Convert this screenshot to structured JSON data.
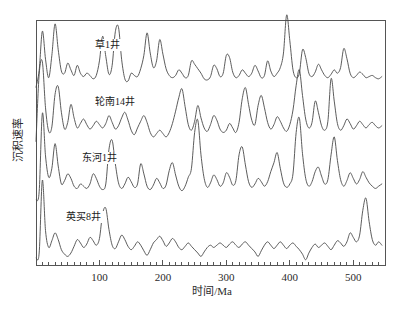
{
  "chart_data": {
    "type": "line",
    "title": "",
    "xlabel": "时间/Ma",
    "ylabel": "沉积速率",
    "xlim": [
      0,
      550
    ],
    "ylim": [
      0,
      4
    ],
    "grid": false,
    "legend_position": "inline-labels",
    "xticks": [
      100,
      200,
      300,
      400,
      500
    ],
    "xtick_labels": [
      "100",
      "200",
      "300",
      "400",
      "500"
    ],
    "xminor_tick_interval": 10,
    "yticks": [],
    "ytick_labels": [],
    "x_step": 5,
    "series": [
      {
        "name": "草1井",
        "label": "草1井",
        "label_x": 95,
        "offset_index": 0,
        "color": "#4a4a4a",
        "values": [
          0.05,
          0.35,
          1.05,
          0.55,
          0.22,
          0.62,
          1.18,
          0.72,
          0.34,
          0.3,
          0.48,
          0.36,
          0.26,
          0.44,
          0.3,
          0.24,
          0.3,
          0.26,
          0.2,
          0.26,
          0.52,
          0.96,
          0.6,
          0.28,
          0.44,
          1.04,
          1.12,
          0.54,
          0.2,
          0.16,
          0.3,
          0.26,
          0.24,
          0.38,
          0.62,
          1.02,
          0.66,
          0.4,
          0.52,
          0.9,
          0.64,
          0.38,
          0.26,
          0.22,
          0.26,
          0.36,
          0.3,
          0.22,
          0.26,
          0.52,
          0.46,
          0.38,
          0.3,
          0.2,
          0.18,
          0.24,
          0.44,
          0.38,
          0.24,
          0.3,
          0.62,
          0.58,
          0.32,
          0.22,
          0.26,
          0.36,
          0.3,
          0.24,
          0.3,
          0.44,
          0.34,
          0.22,
          0.26,
          0.52,
          0.34,
          0.24,
          0.3,
          0.4,
          0.66,
          1.34,
          0.88,
          0.36,
          0.22,
          0.3,
          0.72,
          0.58,
          0.3,
          0.24,
          0.32,
          0.46,
          0.36,
          0.26,
          0.22,
          0.28,
          0.36,
          0.3,
          0.4,
          0.74,
          0.56,
          0.3,
          0.22,
          0.26,
          0.32,
          0.28,
          0.22,
          0.24,
          0.26,
          0.22,
          0.2,
          0.24
        ]
      },
      {
        "name": "轮南14井",
        "label": "轮南14井",
        "label_x": 95,
        "offset_index": 1,
        "color": "#4a4a4a",
        "values": [
          0.1,
          1.3,
          1.52,
          0.7,
          0.28,
          0.36,
          0.94,
          1.08,
          0.62,
          0.32,
          0.44,
          0.76,
          0.52,
          0.34,
          0.42,
          0.5,
          0.4,
          0.32,
          0.38,
          0.46,
          0.4,
          0.34,
          0.42,
          0.56,
          0.44,
          0.32,
          0.38,
          0.52,
          0.62,
          0.48,
          0.3,
          0.22,
          0.34,
          0.46,
          0.56,
          0.44,
          0.26,
          0.18,
          0.24,
          0.3,
          0.24,
          0.18,
          0.26,
          0.42,
          0.64,
          0.88,
          1.04,
          0.72,
          0.4,
          0.3,
          0.46,
          0.74,
          0.52,
          0.34,
          0.28,
          0.4,
          0.56,
          0.48,
          0.32,
          0.26,
          0.3,
          0.42,
          0.34,
          0.26,
          0.44,
          0.86,
          1.06,
          0.76,
          0.48,
          0.4,
          0.74,
          0.92,
          0.7,
          0.44,
          0.32,
          0.4,
          0.54,
          0.46,
          0.34,
          0.28,
          0.4,
          0.66,
          1.1,
          1.38,
          0.92,
          0.5,
          0.34,
          0.44,
          0.82,
          0.62,
          0.38,
          0.3,
          0.46,
          1.22,
          0.82,
          0.42,
          0.3,
          0.38,
          0.5,
          0.42,
          0.32,
          0.38,
          0.46,
          0.4,
          0.34,
          0.4,
          0.44,
          0.38,
          0.34,
          0.38
        ]
      },
      {
        "name": "东河1井",
        "label": "东河1井",
        "label_x": 82,
        "offset_index": 2,
        "color": "#4a4a4a",
        "values": [
          0.06,
          0.2,
          1.6,
          0.84,
          0.46,
          0.62,
          1.06,
          0.66,
          0.34,
          0.4,
          0.52,
          0.44,
          0.3,
          0.26,
          0.34,
          0.3,
          0.26,
          0.34,
          0.52,
          0.44,
          0.3,
          0.24,
          0.34,
          0.96,
          1.12,
          0.7,
          0.36,
          0.26,
          0.34,
          0.46,
          0.38,
          0.28,
          0.34,
          0.7,
          0.52,
          0.3,
          0.24,
          0.32,
          0.44,
          0.36,
          0.26,
          0.32,
          0.58,
          0.72,
          0.5,
          0.3,
          0.22,
          0.3,
          0.46,
          0.62,
          1.26,
          1.48,
          0.86,
          0.44,
          0.28,
          0.36,
          0.5,
          0.42,
          0.3,
          0.36,
          0.54,
          0.46,
          0.32,
          0.4,
          0.86,
          1.0,
          0.68,
          0.38,
          0.28,
          0.34,
          0.44,
          0.38,
          0.3,
          0.38,
          0.56,
          0.72,
          0.9,
          0.62,
          0.36,
          0.28,
          0.34,
          0.52,
          1.26,
          1.52,
          0.88,
          0.44,
          0.3,
          0.38,
          0.56,
          0.64,
          0.48,
          0.34,
          0.42,
          0.86,
          1.18,
          0.76,
          0.42,
          0.3,
          0.4,
          0.54,
          0.44,
          0.34,
          0.42,
          0.56,
          0.46,
          0.36,
          0.3,
          0.26,
          0.3,
          0.34
        ]
      },
      {
        "name": "英买8井",
        "label": "英买8井",
        "label_x": 66,
        "offset_index": 3,
        "color": "#4a4a4a",
        "values": [
          0.08,
          0.16,
          1.46,
          0.56,
          0.26,
          0.38,
          0.52,
          0.4,
          0.22,
          0.14,
          0.1,
          0.16,
          0.28,
          0.4,
          0.34,
          0.26,
          0.32,
          0.44,
          0.38,
          0.3,
          0.42,
          0.86,
          0.96,
          0.58,
          0.3,
          0.24,
          0.36,
          0.48,
          0.4,
          0.28,
          0.22,
          0.28,
          0.36,
          0.3,
          0.2,
          0.12,
          0.22,
          0.34,
          0.4,
          0.46,
          0.38,
          0.28,
          0.34,
          0.42,
          0.36,
          0.26,
          0.22,
          0.28,
          0.34,
          0.28,
          0.22,
          0.16,
          0.1,
          0.18,
          0.26,
          0.3,
          0.26,
          0.3,
          0.34,
          0.3,
          0.26,
          0.32,
          0.36,
          0.3,
          0.26,
          0.32,
          0.36,
          0.3,
          0.24,
          0.18,
          0.1,
          0.2,
          0.3,
          0.36,
          0.3,
          0.24,
          0.3,
          0.36,
          0.3,
          0.24,
          0.3,
          0.34,
          0.28,
          0.22,
          0.14,
          0.04,
          0.16,
          0.26,
          0.32,
          0.26,
          0.3,
          0.34,
          0.28,
          0.22,
          0.3,
          0.38,
          0.34,
          0.28,
          0.36,
          0.52,
          0.44,
          0.36,
          0.48,
          0.92,
          1.14,
          0.72,
          0.4,
          0.3,
          0.36,
          0.3
        ]
      }
    ]
  },
  "axes": {
    "x_axis_title": "时间/Ma",
    "y_axis_title": "沉积速率"
  }
}
